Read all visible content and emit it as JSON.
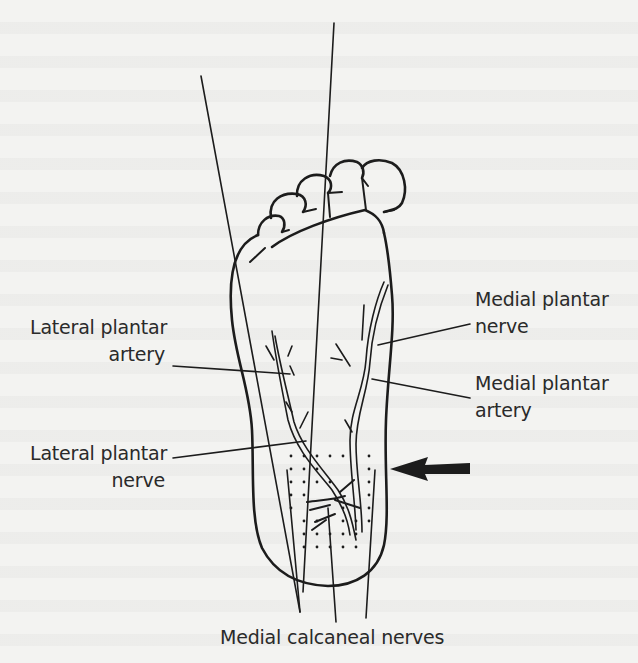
{
  "figure": {
    "type": "anatomical line drawing",
    "labels": {
      "medial_plantar_nerve": [
        "Medial plantar",
        "nerve"
      ],
      "lateral_plantar_artery": [
        "Lateral plantar",
        "artery"
      ],
      "medial_plantar_artery": [
        "Medial plantar",
        "artery"
      ],
      "lateral_plantar_nerve": [
        "Lateral plantar",
        "nerve"
      ],
      "medial_calcaneal_nerves": "Medial calcaneal nerves"
    },
    "arrow": {
      "direction": "left",
      "points_to": "medial heel"
    },
    "stippled_region": "heel (calcaneal area)",
    "colors": {
      "ink": "#1c1c1c",
      "paper": "#f3f3f1",
      "text": "#2a2a2a"
    }
  }
}
